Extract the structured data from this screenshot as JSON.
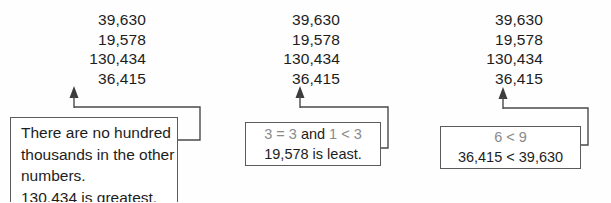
{
  "figure": {
    "kind": "comparison-diagram",
    "background_color": "#fefefe",
    "text_color": "#1d1d1d",
    "muted_text_color": "#8a8a8a",
    "rule_color": "#5b5b5b"
  },
  "panels": [
    {
      "id": "panel-1",
      "numbers": [
        "39,630",
        "19,578",
        "130,434",
        "36,415"
      ],
      "arrow_points_to": "36,415",
      "callout": {
        "lines": [
          {
            "text": "There are no hundred",
            "style": "black"
          },
          {
            "text": "thousands in the other",
            "style": "black"
          },
          {
            "text": "numbers.",
            "style": "black"
          },
          {
            "text": "130,434 is greatest.",
            "style": "black"
          }
        ]
      }
    },
    {
      "id": "panel-2",
      "numbers": [
        "39,630",
        "19,578",
        "130,434",
        "36,415"
      ],
      "arrow_points_to": "36,415",
      "callout": {
        "lines": [
          {
            "text": "3 = 3 and 1 < 3",
            "style": "gray-with-black-and"
          },
          {
            "text": "19,578 is least.",
            "style": "black"
          }
        ]
      }
    },
    {
      "id": "panel-3",
      "numbers": [
        "39,630",
        "19,578",
        "130,434",
        "36,415"
      ],
      "arrow_points_to": "36,415",
      "callout": {
        "lines": [
          {
            "text": "6 < 9",
            "style": "gray"
          },
          {
            "text": "36,415 < 39,630",
            "style": "black"
          }
        ]
      }
    }
  ],
  "callout_2_parts": {
    "pre": "3 = 3 ",
    "conjunction": "and",
    "post": " 1 < 3"
  }
}
